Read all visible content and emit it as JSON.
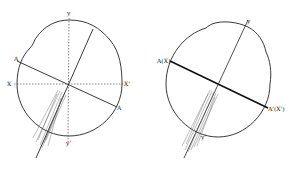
{
  "figure": {
    "left_diagram": {
      "labels": {
        "y_top": "y",
        "y_bottom": "y'",
        "x_left": "X",
        "x_right": "X'",
        "a_left": "A",
        "a_right": "A"
      }
    },
    "right_diagram": {
      "labels": {
        "y_top": "y",
        "y_bottom": "y'",
        "a_left": "A(X)",
        "a_right": "A'(X')"
      }
    },
    "colors": {
      "ink": "#222222",
      "background": "#ffffff"
    }
  }
}
